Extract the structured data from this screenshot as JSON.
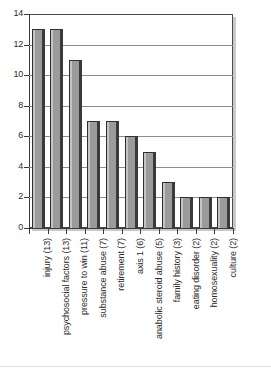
{
  "chart_data": {
    "type": "bar",
    "title": "",
    "subtitle": "",
    "xlabel": "",
    "ylabel": "",
    "ylim": [
      0,
      14
    ],
    "grid": true,
    "legend": null,
    "orientation": "vertical",
    "categories": [
      "injury (13)",
      "psychosocial factors (13)",
      "pressure to win (11)",
      "substance abuse (7)",
      "retirement (7)",
      "axis 1 (6)",
      "anabolic steroid abuse (5)",
      "family history (3)",
      "eating disorder (2)",
      "homosexuality (2)",
      "culture (2)"
    ],
    "values": [
      13,
      13,
      11,
      7,
      7,
      6,
      5,
      3,
      2,
      2,
      2
    ],
    "ytick_labels": [
      "0",
      "2",
      "4",
      "6",
      "8",
      "10",
      "12",
      "14"
    ],
    "ytick_values": [
      0,
      2,
      4,
      6,
      8,
      10,
      12,
      14
    ],
    "colors": {
      "bar_face": "#9b9b9b",
      "bar_highlight": "#c4c4c4",
      "bar_side": "#3a3a3a",
      "gridline": "#8d8d8d",
      "axis": "#3a3a3a",
      "plot_background": "#ffffff",
      "plot_shadow": "#c9c9c9",
      "text": "#2b2b2b",
      "figure_background": "#ffffff"
    }
  }
}
